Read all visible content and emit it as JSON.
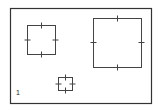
{
  "diagram": {
    "frame": {
      "x": 10,
      "y": 8,
      "width": 141,
      "height": 95,
      "stroke": "#333333"
    },
    "squares": [
      {
        "name": "left-square",
        "x": 27,
        "y": 25,
        "width": 28,
        "height": 29
      },
      {
        "name": "right-square",
        "x": 93,
        "y": 18,
        "width": 48,
        "height": 49
      },
      {
        "name": "small-square",
        "x": 58,
        "y": 77,
        "width": 14,
        "height": 13
      }
    ],
    "tick_length": 5,
    "stroke_color": "#444444",
    "corner_label": "1"
  }
}
